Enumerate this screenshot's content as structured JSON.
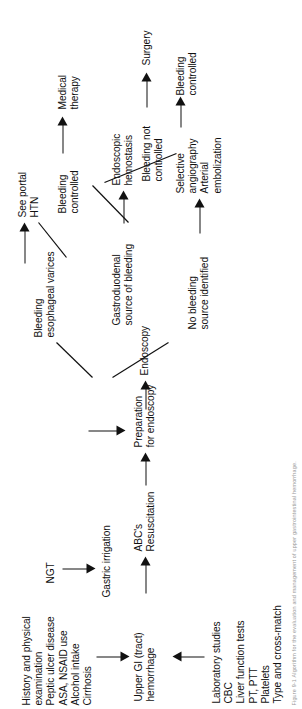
{
  "figure": {
    "orientation": "rotated-90-ccw",
    "background_color": "#ffffff",
    "ink_color": "#111111"
  },
  "nodes": {
    "history": "History and physical examination\nPeptic ulcer disease\nASA, NSAID use\nAlcohol intake\nCirrhosis",
    "upper_gi": "Upper GI (tract)\nhemorrhage",
    "labs": "Laboratory studies\nCBC\nLiver function tests\nPT, PTT\nPlatelets\nType and cross-match",
    "abcs": "ABC's\nResuscitation",
    "ngt": "NGT",
    "gastric_irrigation": "Gastric irrigation",
    "preparation": "Preparation\nfor endoscopy",
    "endoscopy": "Endoscopy",
    "varices": "Bleeding\nesophageal varices",
    "portal_htn": "See portal\nHTN",
    "gastroduodenal": "Gastroduodenal\nsource of bleeding",
    "endoscopic_hemostasis": "Endoscopic\nhemostasis",
    "no_source": "No bleeding\nsource identified",
    "angiography": "Selective\nangiography\nArterial\nembolization",
    "bleeding_controlled_top": "Bleeding\ncontrolled",
    "medical_therapy": "Medical\ntherapy",
    "bleeding_not_controlled": "Bleeding not\ncontrolled",
    "surgery": "Surgery",
    "bleeding_controlled_bottom": "Bleeding\ncontrolled"
  },
  "caption": {
    "text": "Figure 9-1  Algorithm for the evaluation and management of upper gastrointestinal hemorrhage."
  },
  "icons": {
    "arrowhead": "arrow-right-icon"
  }
}
